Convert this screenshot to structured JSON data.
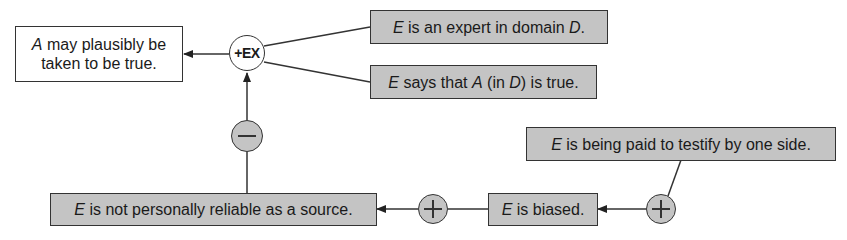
{
  "diagram": {
    "type": "argument-map",
    "colors": {
      "premise_fill": "#c4c4c4",
      "conclusion_fill": "#ffffff",
      "stroke": "#333333"
    },
    "conclusion": {
      "line1_italic": "A",
      "line1_rest": " may plausibly be",
      "line2": "taken to be true."
    },
    "scheme_node": {
      "label": "+EX"
    },
    "premises": {
      "expert": {
        "italic1": "E",
        "text1": " is an expert in domain ",
        "italic2": "D",
        "text2": "."
      },
      "says": {
        "italic1": "E",
        "text1": " says that ",
        "italic2": "A",
        "text2": " (in ",
        "italic3": "D",
        "text3": ") is true."
      }
    },
    "attack_node": {
      "symbol": "minus",
      "label": "−"
    },
    "support_nodes": [
      {
        "symbol": "plus",
        "label": "+"
      },
      {
        "symbol": "plus",
        "label": "+"
      }
    ],
    "nodes": {
      "not_reliable": {
        "italic": "E",
        "text": " is not personally reliable as a source."
      },
      "biased": {
        "italic": "E",
        "text": " is biased."
      },
      "paid": {
        "italic": "E",
        "text": " is being paid to testify by one side."
      }
    }
  }
}
